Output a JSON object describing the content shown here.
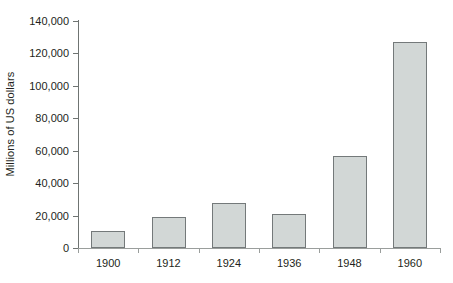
{
  "chart_data": {
    "type": "bar",
    "title": "",
    "subtitle": "",
    "xlabel": "",
    "ylabel": "Millions of US dollars",
    "categories": [
      "1900",
      "1912",
      "1924",
      "1936",
      "1948",
      "1960"
    ],
    "values": [
      10500,
      19300,
      27500,
      21000,
      57000,
      127000
    ],
    "ylim": [
      0,
      140000
    ],
    "ytick_labels": [
      "0",
      "20,000",
      "40,000",
      "60,000",
      "80,000",
      "100,000",
      "120,000",
      "140,000"
    ],
    "ytick_values": [
      0,
      20000,
      40000,
      60000,
      80000,
      100000,
      120000,
      140000
    ],
    "grid": false,
    "legend": null,
    "legend_position": "none",
    "series": [
      {
        "name": "",
        "values": [
          10500,
          19300,
          27500,
          21000,
          57000,
          127000
        ]
      }
    ],
    "colors": {
      "bar_fill": "#d2d7d6",
      "bar_border": "#74797a",
      "axis": "#6f7472",
      "text": "#231f20",
      "background": "#ffffff"
    }
  }
}
